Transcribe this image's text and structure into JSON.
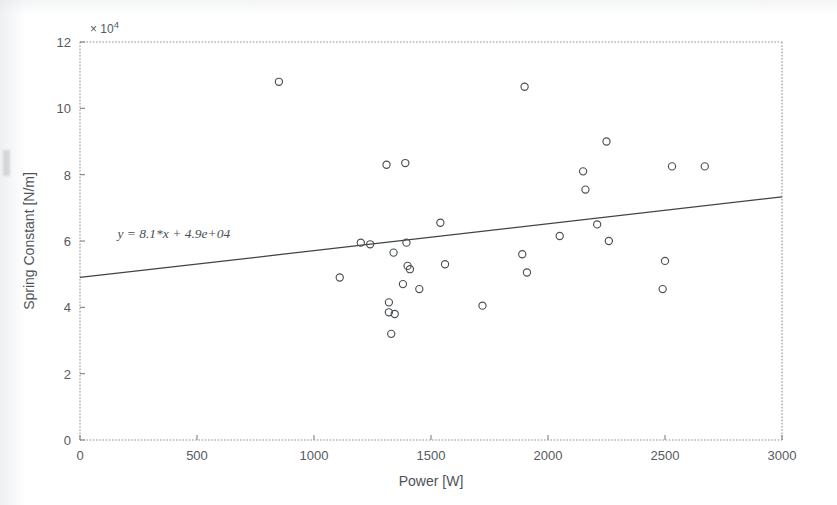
{
  "chart_data": {
    "type": "scatter",
    "title": "",
    "xlabel": "Power [W]",
    "ylabel": "Spring Constant [N/m]",
    "xlim": [
      0,
      3000
    ],
    "ylim": [
      0,
      120000
    ],
    "y_axis_multiplier": "× 10",
    "y_axis_multiplier_exponent": "4",
    "xticks": [
      0,
      500,
      1000,
      1500,
      2000,
      2500,
      3000
    ],
    "xtick_labels": [
      "0",
      "500",
      "1000",
      "1500",
      "2000",
      "2500",
      "3000"
    ],
    "yticks": [
      0,
      20000,
      40000,
      60000,
      80000,
      100000,
      120000
    ],
    "ytick_labels": [
      "0",
      "2",
      "4",
      "6",
      "8",
      "10",
      "12"
    ],
    "grid": false,
    "legend": null,
    "marker": "open-circle",
    "annotations": [
      {
        "text": "y = 8.1*x + 4.9e+04",
        "x": 160,
        "y": 61000
      }
    ],
    "fit_line": {
      "type": "linear",
      "slope": 8.1,
      "intercept": 49000,
      "equation": "y = 8.1*x + 4.9e+04",
      "x_start": 0,
      "x_end": 3000,
      "y_start": 49000,
      "y_end": 73300
    },
    "points": [
      {
        "x": 850,
        "y": 108000
      },
      {
        "x": 1110,
        "y": 49000
      },
      {
        "x": 1200,
        "y": 59500
      },
      {
        "x": 1240,
        "y": 59000
      },
      {
        "x": 1310,
        "y": 83000
      },
      {
        "x": 1320,
        "y": 41500
      },
      {
        "x": 1320,
        "y": 38500
      },
      {
        "x": 1340,
        "y": 56500
      },
      {
        "x": 1345,
        "y": 38000
      },
      {
        "x": 1330,
        "y": 32000
      },
      {
        "x": 1380,
        "y": 47000
      },
      {
        "x": 1390,
        "y": 83500
      },
      {
        "x": 1395,
        "y": 59500
      },
      {
        "x": 1400,
        "y": 52500
      },
      {
        "x": 1410,
        "y": 51500
      },
      {
        "x": 1450,
        "y": 45500
      },
      {
        "x": 1540,
        "y": 65500
      },
      {
        "x": 1560,
        "y": 53000
      },
      {
        "x": 1720,
        "y": 40500
      },
      {
        "x": 1900,
        "y": 106500
      },
      {
        "x": 1890,
        "y": 56000
      },
      {
        "x": 1910,
        "y": 50500
      },
      {
        "x": 2050,
        "y": 61500
      },
      {
        "x": 2150,
        "y": 81000
      },
      {
        "x": 2160,
        "y": 75500
      },
      {
        "x": 2210,
        "y": 65000
      },
      {
        "x": 2250,
        "y": 90000
      },
      {
        "x": 2260,
        "y": 60000
      },
      {
        "x": 2500,
        "y": 54000
      },
      {
        "x": 2490,
        "y": 45500
      },
      {
        "x": 2530,
        "y": 82500
      },
      {
        "x": 2670,
        "y": 82500
      }
    ]
  }
}
